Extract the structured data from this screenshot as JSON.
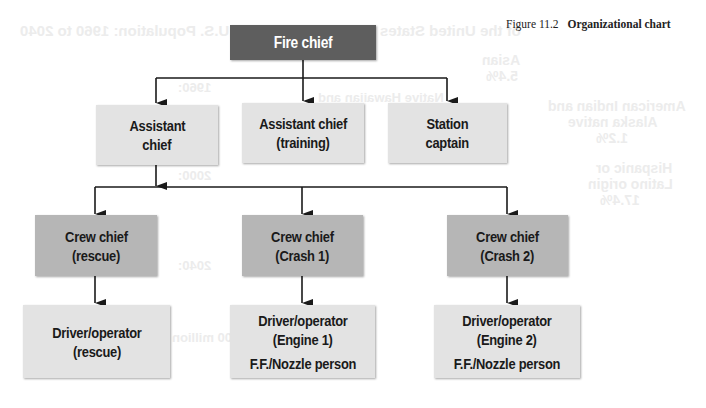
{
  "figure": {
    "number": "Figure 11.2",
    "title": "Organizational chart"
  },
  "colors": {
    "top_level": "#5e5e5e",
    "crew_chief": "#b6b6b6",
    "staff": "#e3e3e3",
    "connector": "#1a1a1a"
  },
  "nodes": {
    "fire_chief": {
      "lines": [
        "Fire chief"
      ]
    },
    "assistant_chief": {
      "lines": [
        "Assistant",
        "chief"
      ]
    },
    "assistant_chief_training": {
      "lines": [
        "Assistant chief",
        "(training)"
      ]
    },
    "station_captain": {
      "lines": [
        "Station",
        "captain"
      ]
    },
    "crew_chief_rescue": {
      "lines": [
        "Crew chief",
        "(rescue)"
      ]
    },
    "crew_chief_crash1": {
      "lines": [
        "Crew chief",
        "(Crash 1)"
      ]
    },
    "crew_chief_crash2": {
      "lines": [
        "Crew chief",
        "(Crash 2)"
      ]
    },
    "driver_rescue": {
      "lines": [
        "Driver/operator",
        "(rescue)"
      ]
    },
    "driver_engine1": {
      "lines": [
        "Driver/operator",
        "(Engine 1)",
        "F.F./Nozzle person"
      ]
    },
    "driver_engine2": {
      "lines": [
        "Driver/operator",
        "(Engine 2)",
        "F.F./Nozzle person"
      ]
    }
  },
  "edges": [
    [
      "fire_chief",
      "assistant_chief"
    ],
    [
      "fire_chief",
      "assistant_chief_training"
    ],
    [
      "fire_chief",
      "station_captain"
    ],
    [
      "assistant_chief",
      "crew_chief_rescue"
    ],
    [
      "assistant_chief",
      "crew_chief_crash1"
    ],
    [
      "assistant_chief",
      "crew_chief_crash2"
    ],
    [
      "crew_chief_rescue",
      "driver_rescue"
    ],
    [
      "crew_chief_crash1",
      "driver_engine1"
    ],
    [
      "crew_chief_crash2",
      "driver_engine2"
    ]
  ],
  "bleed_through": {
    "l1": "of the United States",
    "l2": "of U.S. Population: 1960 to 2040",
    "l3": "Asian",
    "l4": "5.4%",
    "l5": "American Indian and",
    "l6": "Alaska native",
    "l7": "1.2%",
    "l8": "Hispanic or",
    "l9": "Latino origin",
    "l10": "17.4%",
    "l11": "1960:",
    "l12": "2000:",
    "l13": "2040:",
    "l14": "Native Hawaiian and",
    "l15": "+ 100 million"
  }
}
